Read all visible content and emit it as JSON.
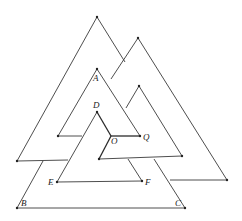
{
  "figure": {
    "labels": {
      "A": "A",
      "B": "B",
      "C": "C",
      "D": "D",
      "E": "E",
      "F": "F",
      "O": "O",
      "Q": "Q"
    },
    "points": {
      "A": [
        97,
        69
      ],
      "B": [
        17,
        208
      ],
      "C": [
        185,
        208
      ],
      "D": [
        97,
        112
      ],
      "E": [
        57,
        182
      ],
      "F": [
        142,
        181
      ],
      "O": [
        111,
        136
      ],
      "Q": [
        140,
        136
      ]
    },
    "colors": {
      "line": "#3a3a3a",
      "background": "#ffffff"
    }
  }
}
